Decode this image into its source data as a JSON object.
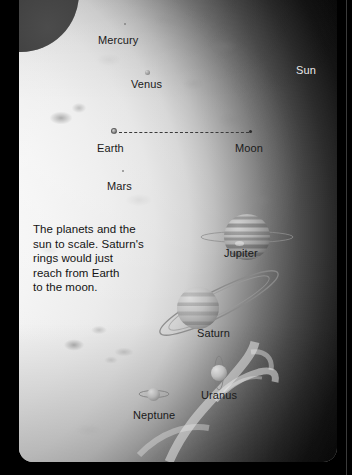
{
  "figure": {
    "title": "The planets and the sun to scale",
    "caption": "The planets and the\nsun to scale. Saturn's\nrings would just\nreach from Earth\nto the moon.",
    "background_color": "#000000",
    "plate_color": "#b9b9b9",
    "label_color": "#1a1a1a",
    "light_label_color": "#e8e8e8"
  },
  "bodies": [
    {
      "id": "sun",
      "label": "Sun",
      "label_style": "light",
      "label_x": 277,
      "label_y": 64,
      "marker": "disc-backdrop",
      "diameter_px": 0,
      "x": 0,
      "y": 0
    },
    {
      "id": "mercury",
      "label": "Mercury",
      "label_style": "dark",
      "label_x": 79,
      "label_y": 34,
      "marker": "speck",
      "diameter_px": 2,
      "x": 105,
      "y": 23
    },
    {
      "id": "venus",
      "label": "Venus",
      "label_style": "dark",
      "label_x": 112,
      "label_y": 78,
      "marker": "disc",
      "diameter_px": 5,
      "x": 126,
      "y": 70
    },
    {
      "id": "earth",
      "label": "Earth",
      "label_style": "dark",
      "label_x": 78,
      "label_y": 142,
      "marker": "disc",
      "diameter_px": 6,
      "x": 95,
      "y": 131
    },
    {
      "id": "moon",
      "label": "Moon",
      "label_style": "dark",
      "label_x": 216,
      "label_y": 142,
      "marker": "dot",
      "diameter_px": 3,
      "x": 232,
      "y": 131
    },
    {
      "id": "mars",
      "label": "Mars",
      "label_style": "dark",
      "label_x": 88,
      "label_y": 180,
      "marker": "speck",
      "diameter_px": 2,
      "x": 103,
      "y": 170
    },
    {
      "id": "jupiter",
      "label": "Jupiter",
      "label_style": "dark",
      "label_x": 205,
      "label_y": 247,
      "marker": "banded-disc",
      "diameter_px": 46,
      "x": 228,
      "y": 214
    },
    {
      "id": "saturn",
      "label": "Saturn",
      "label_style": "dark",
      "label_x": 178,
      "label_y": 327,
      "marker": "ringed-disc",
      "diameter_px": 42,
      "x": 199,
      "y": 292
    },
    {
      "id": "uranus",
      "label": "Uranus",
      "label_style": "dark",
      "label_x": 182,
      "label_y": 389,
      "marker": "ringed-disc",
      "diameter_px": 16,
      "x": 204,
      "y": 367
    },
    {
      "id": "neptune",
      "label": "Neptune",
      "label_style": "dark",
      "label_x": 114,
      "label_y": 409,
      "marker": "ringed-disc",
      "diameter_px": 13,
      "x": 138,
      "y": 390
    }
  ],
  "annotations": {
    "earth_moon_line": {
      "name": "earth-moon-distance-line",
      "style": "dashed",
      "from": "Earth",
      "to": "Moon",
      "x1": 100,
      "x2": 230,
      "y": 131
    }
  }
}
